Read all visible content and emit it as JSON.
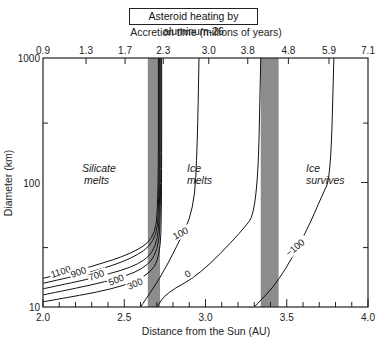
{
  "chart_data": {
    "type": "line",
    "title": "Asteroid heating by aluminum-26",
    "xlabel": "Distance from the Sun (AU)",
    "ylabel": "Diameter (km)",
    "x2label": "Accretion time (millions of years)",
    "xlim": [
      2.0,
      4.0
    ],
    "ylim": [
      10,
      1000
    ],
    "yscale": "log",
    "grid": false,
    "xticks": [
      "2.0",
      "2.5",
      "3.0",
      "3.5",
      "4.0"
    ],
    "yticks": [
      "10",
      "100",
      "1000"
    ],
    "x2ticks": [
      "0.9",
      "1.3",
      "1.7",
      "2.3",
      "3.0",
      "3.8",
      "4.8",
      "5.9",
      "7.1"
    ],
    "x2tick_positions_au": [
      2.0,
      2.265,
      2.505,
      2.74,
      3.02,
      3.26,
      3.51,
      3.76,
      4.0
    ],
    "shaded_bands_au": [
      [
        2.645,
        2.72
      ],
      [
        3.34,
        3.45
      ]
    ],
    "region_labels": [
      {
        "text": "Silicate melts",
        "x_au": 2.3,
        "y_km": 80
      },
      {
        "text": "Ice melts",
        "x_au": 2.88,
        "y_km": 80
      },
      {
        "text": "Ice survives",
        "x_au": 3.6,
        "y_km": 80
      }
    ],
    "series": [
      {
        "name": "1100",
        "label": "1100",
        "points": [
          [
            2.0,
            17
          ],
          [
            2.3,
            21
          ],
          [
            2.55,
            27
          ],
          [
            2.68,
            35
          ],
          [
            2.71,
            60
          ],
          [
            2.71,
            1000
          ]
        ]
      },
      {
        "name": "900",
        "label": "900",
        "points": [
          [
            2.0,
            15.5
          ],
          [
            2.3,
            19
          ],
          [
            2.55,
            24.5
          ],
          [
            2.69,
            33
          ],
          [
            2.715,
            60
          ],
          [
            2.715,
            1000
          ]
        ]
      },
      {
        "name": "700",
        "label": "700",
        "points": [
          [
            2.0,
            14
          ],
          [
            2.35,
            17.5
          ],
          [
            2.6,
            22
          ],
          [
            2.7,
            30
          ],
          [
            2.72,
            60
          ],
          [
            2.72,
            1000
          ]
        ]
      },
      {
        "name": "500",
        "label": "500",
        "points": [
          [
            2.0,
            12.5
          ],
          [
            2.4,
            16
          ],
          [
            2.62,
            20
          ],
          [
            2.71,
            28
          ],
          [
            2.725,
            60
          ],
          [
            2.725,
            1000
          ]
        ]
      },
      {
        "name": "300",
        "label": "300",
        "points": [
          [
            2.0,
            11
          ],
          [
            2.45,
            14
          ],
          [
            2.65,
            18
          ],
          [
            2.72,
            25
          ],
          [
            2.73,
            60
          ],
          [
            2.73,
            1000
          ]
        ]
      },
      {
        "name": "100",
        "label": "100",
        "points": [
          [
            2.6,
            10
          ],
          [
            2.72,
            17
          ],
          [
            2.82,
            30
          ],
          [
            2.93,
            60
          ],
          [
            2.95,
            200
          ],
          [
            2.96,
            1000
          ]
        ]
      },
      {
        "name": "0",
        "label": "0",
        "points": [
          [
            2.7,
            10
          ],
          [
            2.76,
            13
          ],
          [
            2.96,
            18
          ],
          [
            3.22,
            40
          ],
          [
            3.32,
            60
          ],
          [
            3.34,
            1000
          ]
        ]
      },
      {
        "name": "-100",
        "label": "−100",
        "points": [
          [
            3.3,
            10
          ],
          [
            3.45,
            16
          ],
          [
            3.62,
            40
          ],
          [
            3.72,
            80
          ],
          [
            3.77,
            110
          ],
          [
            3.79,
            1000
          ]
        ]
      }
    ]
  },
  "title": "Asteroid heating by aluminum-26",
  "labels": {
    "x2label": "Accretion time (millions of years)",
    "xlabel": "Distance from the Sun (AU)",
    "ylabel": "Diameter (km)",
    "silicate_1": "Silicate",
    "silicate_2": "melts",
    "icemelts_1": "Ice",
    "icemelts_2": "melts",
    "icesurv_1": "Ice",
    "icesurv_2": "survives"
  },
  "colors": {
    "band": "#8c8c8c",
    "line": "#111111",
    "frame": "#222222"
  }
}
